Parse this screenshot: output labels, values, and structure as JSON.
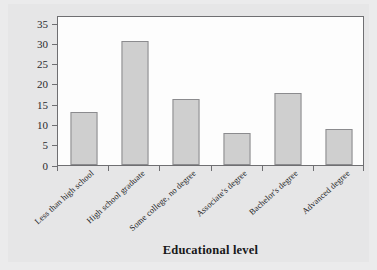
{
  "chart_data": {
    "type": "bar",
    "title": "",
    "xlabel": "Educational level",
    "ylabel": "Percentage",
    "categories": [
      "Less than high school",
      "High school graduate",
      "Some college, no degree",
      "Associate's degree",
      "Bachelor's degree",
      "Advanced degree"
    ],
    "values": [
      13.2,
      30.7,
      16.3,
      7.8,
      17.7,
      8.8
    ],
    "yticks": [
      0,
      5,
      10,
      15,
      20,
      25,
      30,
      35
    ],
    "ytick_labels": [
      "0",
      "5",
      "10",
      "15",
      "20",
      "25",
      "30",
      "35"
    ],
    "ylim": [
      0,
      37
    ],
    "grid": false,
    "legend": false,
    "legend_position": "none",
    "bar_color": "#cfcfcf",
    "bar_edge_color": "#8b8b8e",
    "panel_color": "#fdfdfd",
    "background_color": "#e6e6e7",
    "axis_color": "#6f6f72"
  }
}
